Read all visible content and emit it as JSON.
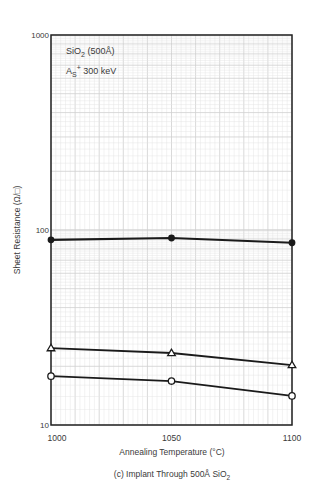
{
  "chart_data": {
    "type": "line",
    "title": "",
    "caption": "(c) Implant Through 500Å SiO2",
    "caption_main": "(c)  Implant Through 500Å SiO",
    "caption_sub": "2",
    "xlabel": "Annealing Temperature (°C)",
    "ylabel": "Sheet Resistance (Ω/□)",
    "x": [
      1000,
      1050,
      1100
    ],
    "x_ticks": [
      "1000",
      "1050",
      "1100"
    ],
    "xlim": [
      1000,
      1100
    ],
    "yscale": "log",
    "ylim": [
      10,
      1000
    ],
    "y_ticks": [
      "10",
      "100",
      "1000"
    ],
    "grid": true,
    "annotations": [
      {
        "text": "SiO2 (500Å)",
        "main": "SiO",
        "sub": "2",
        "rest": " (500Å)"
      },
      {
        "text": "As+ 300 keV",
        "main": "A",
        "sub": "S",
        "sup": "+",
        "rest": " 300 keV"
      }
    ],
    "series": [
      {
        "name": "filled-circle",
        "marker": "filled-circle",
        "values": [
          89,
          91,
          86
        ]
      },
      {
        "name": "open-triangle",
        "marker": "open-triangle",
        "values": [
          24.8,
          23.4,
          20.3
        ]
      },
      {
        "name": "open-circle",
        "marker": "open-circle",
        "values": [
          17.8,
          16.8,
          14.1
        ]
      }
    ],
    "legend": null
  },
  "colors": {
    "line": "#1a1a1a",
    "frame": "#222222",
    "grid_minor": "#e4e4e4",
    "grid_major": "#cfcfcf",
    "text": "#3a3a3a"
  }
}
